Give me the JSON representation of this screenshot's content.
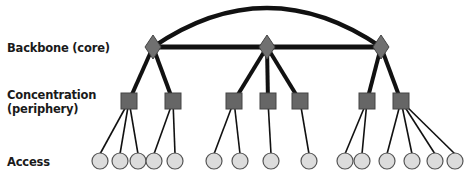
{
  "diagram": {
    "type": "hierarchical-network-topology",
    "levels": [
      {
        "id": "backbone",
        "label": "Backbone (core)",
        "shape": "diamond"
      },
      {
        "id": "concentration",
        "label_line1": "Concentration",
        "label_line2": "(periphery)",
        "shape": "square"
      },
      {
        "id": "access",
        "label": "Access",
        "shape": "circle"
      }
    ],
    "colors": {
      "backbone_fill": "#707070",
      "concentration_fill": "#666666",
      "access_fill": "#dcdcdc",
      "edge": "#111111",
      "node_stroke": "#555555"
    },
    "backbone_nodes": [
      {
        "id": "B1",
        "x": 153,
        "y": 47
      },
      {
        "id": "B2",
        "x": 267,
        "y": 47
      },
      {
        "id": "B3",
        "x": 381,
        "y": 47
      }
    ],
    "backbone_links": [
      {
        "from": "B1",
        "to": "B2",
        "style": "straight"
      },
      {
        "from": "B2",
        "to": "B3",
        "style": "straight"
      },
      {
        "from": "B1",
        "to": "B3",
        "style": "arc"
      }
    ],
    "concentration_nodes": [
      {
        "id": "C1",
        "x": 129,
        "y": 101,
        "parent": "B1"
      },
      {
        "id": "C2",
        "x": 173,
        "y": 101,
        "parent": "B1"
      },
      {
        "id": "C3",
        "x": 234,
        "y": 101,
        "parent": "B2"
      },
      {
        "id": "C4",
        "x": 268,
        "y": 101,
        "parent": "B2"
      },
      {
        "id": "C5",
        "x": 300,
        "y": 101,
        "parent": "B2"
      },
      {
        "id": "C6",
        "x": 367,
        "y": 101,
        "parent": "B3"
      },
      {
        "id": "C7",
        "x": 401,
        "y": 101,
        "parent": "B3"
      }
    ],
    "access_nodes": [
      {
        "id": "A1",
        "x": 100,
        "y": 161,
        "parent": "C1"
      },
      {
        "id": "A2",
        "x": 120,
        "y": 161,
        "parent": "C1"
      },
      {
        "id": "A3",
        "x": 138,
        "y": 161,
        "parent": "C1"
      },
      {
        "id": "A4",
        "x": 154,
        "y": 161,
        "parent": "C2"
      },
      {
        "id": "A5",
        "x": 175,
        "y": 161,
        "parent": "C2"
      },
      {
        "id": "A6",
        "x": 214,
        "y": 161,
        "parent": "C3"
      },
      {
        "id": "A7",
        "x": 240,
        "y": 161,
        "parent": "C3"
      },
      {
        "id": "A8",
        "x": 271,
        "y": 161,
        "parent": "C4"
      },
      {
        "id": "A9",
        "x": 309,
        "y": 161,
        "parent": "C5"
      },
      {
        "id": "A10",
        "x": 345,
        "y": 161,
        "parent": "C6"
      },
      {
        "id": "A11",
        "x": 362,
        "y": 161,
        "parent": "C6"
      },
      {
        "id": "A12",
        "x": 387,
        "y": 161,
        "parent": "C7"
      },
      {
        "id": "A13",
        "x": 412,
        "y": 161,
        "parent": "C7"
      },
      {
        "id": "A14",
        "x": 435,
        "y": 161,
        "parent": "C7"
      },
      {
        "id": "A15",
        "x": 455,
        "y": 161,
        "parent": "C7"
      }
    ]
  }
}
